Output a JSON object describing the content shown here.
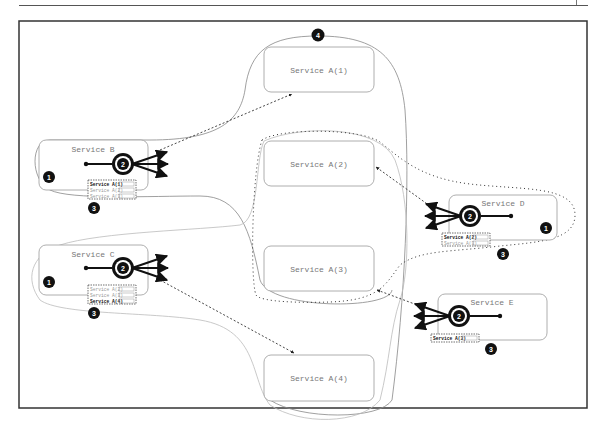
{
  "figure": {
    "frame": {
      "x": 19,
      "y": 21,
      "w": 568,
      "h": 387
    },
    "colors": {
      "frame": "#333333",
      "box_border": "#9a9a9a",
      "box_text": "#777777",
      "badge": "#111111",
      "arrow": "#111111",
      "boundary_solid": "#888888",
      "boundary_light": "#bbbbbb"
    }
  },
  "services_a": [
    {
      "label": "Service A(1)",
      "x": 264,
      "y": 47,
      "w": 110,
      "h": 45
    },
    {
      "label": "Service A(2)",
      "x": 264,
      "y": 141,
      "w": 110,
      "h": 45
    },
    {
      "label": "Service A(3)",
      "x": 264,
      "y": 246,
      "w": 110,
      "h": 45
    },
    {
      "label": "Service A(4)",
      "x": 264,
      "y": 355,
      "w": 110,
      "h": 46
    }
  ],
  "clients": [
    {
      "label": "Service B",
      "x": 39,
      "y": 140,
      "w": 109,
      "h": 50,
      "badge1": {
        "text": "1",
        "x": 49,
        "y": 177
      },
      "hub": {
        "text": "2",
        "x": 123,
        "y": 164,
        "dir": "right"
      },
      "badge3": {
        "text": "3",
        "x": 94,
        "y": 208
      },
      "table": {
        "x": 88,
        "y": 180,
        "rows": [
          {
            "name": "Service A(1)",
            "value": "33",
            "bold": true
          },
          {
            "name": "Service A(2)",
            "value": "33",
            "bold": false
          },
          {
            "name": "Service A(3)",
            "value": "33",
            "bold": false
          }
        ]
      }
    },
    {
      "label": "Service C",
      "x": 39,
      "y": 245,
      "w": 109,
      "h": 50,
      "badge1": {
        "text": "1",
        "x": 49,
        "y": 282
      },
      "hub": {
        "text": "2",
        "x": 123,
        "y": 268,
        "dir": "right"
      },
      "badge3": {
        "text": "3",
        "x": 94,
        "y": 313
      },
      "table": {
        "x": 88,
        "y": 285,
        "rows": [
          {
            "name": "Service A(2)",
            "value": "90",
            "bold": false
          },
          {
            "name": "Service A(3)",
            "value": "10",
            "bold": false
          },
          {
            "name": "Service A(4)",
            "value": "0",
            "bold": true
          }
        ]
      }
    },
    {
      "label": "Service D",
      "x": 449,
      "y": 195,
      "w": 108,
      "h": 45,
      "badge1": {
        "text": "1",
        "x": 546,
        "y": 228
      },
      "hub": {
        "text": "2",
        "x": 470,
        "y": 216,
        "dir": "left"
      },
      "badge3": {
        "text": "3",
        "x": 503,
        "y": 254
      },
      "table": {
        "x": 442,
        "y": 233,
        "rows": [
          {
            "name": "Service A(2)",
            "value": "100",
            "bold": true
          },
          {
            "name": "Service A(3)",
            "value": "0",
            "bold": false
          }
        ]
      }
    },
    {
      "label": "Service E",
      "x": 438,
      "y": 294,
      "w": 109,
      "h": 46,
      "badge1": null,
      "hub": {
        "text": "2",
        "x": 459,
        "y": 316,
        "dir": "left"
      },
      "badge3": {
        "text": "3",
        "x": 491,
        "y": 349
      },
      "table": {
        "x": 431,
        "y": 335,
        "rows": [
          {
            "name": "Service A(3)",
            "value": "100",
            "bold": true
          }
        ]
      }
    }
  ],
  "top_badge": {
    "text": "4",
    "x": 318,
    "y": 35
  },
  "connections": [
    {
      "from": "Service B",
      "to": "Service A(1)"
    },
    {
      "from": "Service C",
      "to": "Service A(4)"
    },
    {
      "from": "Service D",
      "to": "Service A(2)"
    },
    {
      "from": "Service E",
      "to": "Service A(3)"
    }
  ]
}
